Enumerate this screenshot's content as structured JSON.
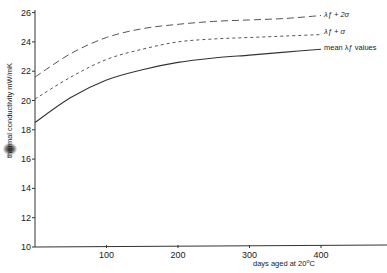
{
  "chart_data": {
    "type": "line",
    "title": "",
    "xlabel": "days aged at 20°C",
    "ylabel": "thermal conductivity  mW/mK",
    "xlim": [
      0,
      480
    ],
    "ylim": [
      10,
      26
    ],
    "x_ticks": [
      100,
      200,
      300,
      400
    ],
    "y_ticks": [
      10,
      12,
      14,
      16,
      18,
      20,
      22,
      24,
      26
    ],
    "grid": false,
    "legend_position": "inline-right",
    "x": [
      0,
      50,
      100,
      150,
      200,
      250,
      300,
      350,
      400
    ],
    "series": [
      {
        "name": "λf + 2σ",
        "style": "dashed",
        "values": [
          21.6,
          23.2,
          24.3,
          24.9,
          25.2,
          25.4,
          25.5,
          25.6,
          25.8
        ]
      },
      {
        "name": "λf + σ",
        "style": "dotted",
        "values": [
          20.1,
          21.6,
          22.8,
          23.5,
          24.0,
          24.2,
          24.3,
          24.4,
          24.5
        ]
      },
      {
        "name": "mean λf values",
        "style": "solid",
        "values": [
          18.5,
          20.2,
          21.4,
          22.1,
          22.6,
          22.9,
          23.1,
          23.3,
          23.5
        ]
      }
    ]
  },
  "labels": {
    "series_2sigma": "λƒ + 2σ",
    "series_sigma": "λƒ + σ",
    "series_mean": "mean λƒ  values",
    "xlabel": "days aged at 20",
    "xlabel_unit": "C",
    "xlabel_deg": "o",
    "ylabel": "thermal conductivity  mW/mK"
  }
}
